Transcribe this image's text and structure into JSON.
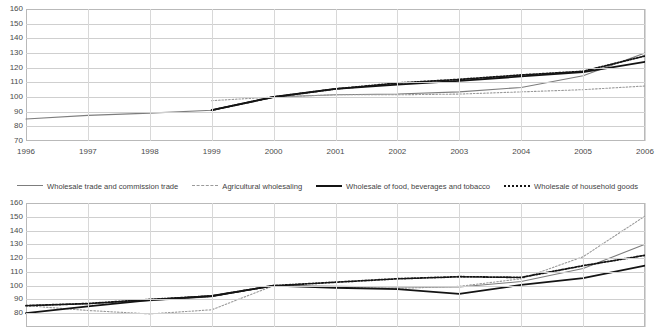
{
  "legend": {
    "items": [
      {
        "label": "Wholesale trade and commission trade",
        "style": "solid-gray",
        "color": "#7d7d7d"
      },
      {
        "label": "Agricultural wholesaling",
        "style": "dash-gray",
        "color": "#9a9a9a"
      },
      {
        "label": "Wholesale of food, beverages and tobacco",
        "style": "solid-black",
        "color": "#141414"
      },
      {
        "label": "Wholesale of household goods",
        "style": "dot-black",
        "color": "#141414"
      }
    ]
  },
  "chart_data": [
    {
      "id": "chart-top",
      "type": "line",
      "title": "",
      "xlabel": "",
      "ylabel": "",
      "x": [
        1996,
        1997,
        1998,
        1999,
        2000,
        2001,
        2002,
        2003,
        2004,
        2005,
        2006
      ],
      "tick_labels": [
        "1996",
        "1997",
        "1998",
        "1999",
        "2000",
        "2001",
        "2002",
        "2003",
        "2004",
        "2005",
        "2006"
      ],
      "ylim": [
        70,
        160
      ],
      "yticks": [
        70,
        80,
        90,
        100,
        110,
        120,
        130,
        140,
        150,
        160
      ],
      "ytick_labels": [
        "70",
        "80",
        "90",
        "100",
        "110",
        "120",
        "130",
        "140",
        "150",
        "160"
      ],
      "grid": true,
      "legend_position": "below",
      "series": [
        {
          "name": "Wholesale trade and commission trade",
          "style": "solid-gray",
          "color": "#7d7d7d",
          "x": [
            1996,
            1997,
            1998,
            1999,
            2000,
            2001,
            2002,
            2003,
            2004,
            2005,
            2006
          ],
          "values": [
            85.0,
            87.5,
            89.0,
            91.0,
            100.0,
            101.5,
            102.0,
            103.5,
            106.5,
            114.5,
            130.0
          ]
        },
        {
          "name": "Agricultural wholesaling",
          "style": "dash-gray",
          "color": "#9a9a9a",
          "x": [
            1999,
            2000,
            2001,
            2002,
            2003,
            2004,
            2005,
            2006
          ],
          "values": [
            97.5,
            100.0,
            101.5,
            101.5,
            102.0,
            103.5,
            105.0,
            107.5
          ]
        },
        {
          "name": "Wholesale of food, beverages and tobacco",
          "style": "solid-black",
          "color": "#141414",
          "x": [
            1999,
            2000,
            2001,
            2002,
            2003,
            2004,
            2005,
            2006
          ],
          "values": [
            91.0,
            100.0,
            105.5,
            108.5,
            111.0,
            114.0,
            117.0,
            124.0
          ]
        },
        {
          "name": "Wholesale of household goods",
          "style": "dot-black",
          "color": "#141414",
          "x": [
            1999,
            2000,
            2001,
            2002,
            2003,
            2004,
            2005,
            2006
          ],
          "values": [
            91.0,
            100.0,
            105.5,
            109.5,
            112.0,
            115.0,
            117.5,
            128.0
          ]
        }
      ]
    },
    {
      "id": "chart-bottom",
      "type": "line",
      "title": "",
      "xlabel": "",
      "ylabel": "",
      "x": [
        1996,
        1997,
        1998,
        1999,
        2000,
        2001,
        2002,
        2003,
        2004,
        2005,
        2006
      ],
      "tick_labels": [],
      "ylim": [
        70,
        160
      ],
      "yticks": [
        80,
        90,
        100,
        110,
        120,
        130,
        140,
        150,
        160
      ],
      "ytick_labels": [
        "80",
        "90",
        "100",
        "110",
        "120",
        "130",
        "140",
        "150",
        "160"
      ],
      "grid": true,
      "legend_position": "above",
      "series": [
        {
          "name": "Wholesale trade and commission trade",
          "style": "solid-gray",
          "color": "#7d7d7d",
          "x": [
            1996,
            1997,
            1998,
            1999,
            2000,
            2001,
            2002,
            2003,
            2004,
            2005,
            2006
          ],
          "values": [
            85.5,
            87.0,
            89.0,
            92.0,
            100.0,
            99.5,
            99.0,
            99.0,
            103.0,
            112.5,
            130.0
          ]
        },
        {
          "name": "Agricultural wholesaling",
          "style": "dash-gray",
          "color": "#9a9a9a",
          "x": [
            1996,
            1997,
            1998,
            1999,
            2000,
            2001,
            2002,
            2003,
            2004,
            2005,
            2006
          ],
          "values": [
            85.5,
            82.0,
            79.5,
            82.5,
            100.0,
            99.0,
            98.0,
            99.5,
            105.0,
            121.0,
            150.5
          ]
        },
        {
          "name": "Wholesale of food, beverages and tobacco",
          "style": "solid-black",
          "color": "#141414",
          "x": [
            1996,
            1997,
            1998,
            1999,
            2000,
            2001,
            2002,
            2003,
            2004,
            2005,
            2006
          ],
          "values": [
            80.0,
            85.0,
            89.5,
            92.5,
            100.0,
            98.5,
            97.5,
            94.0,
            100.5,
            105.5,
            114.5
          ]
        },
        {
          "name": "Wholesale of household goods",
          "style": "dot-black",
          "color": "#141414",
          "x": [
            1996,
            1997,
            1998,
            1999,
            2000,
            2001,
            2002,
            2003,
            2004,
            2005,
            2006
          ],
          "values": [
            85.5,
            87.0,
            90.0,
            92.5,
            100.0,
            102.5,
            105.0,
            106.5,
            106.0,
            114.5,
            122.0
          ]
        }
      ]
    }
  ]
}
